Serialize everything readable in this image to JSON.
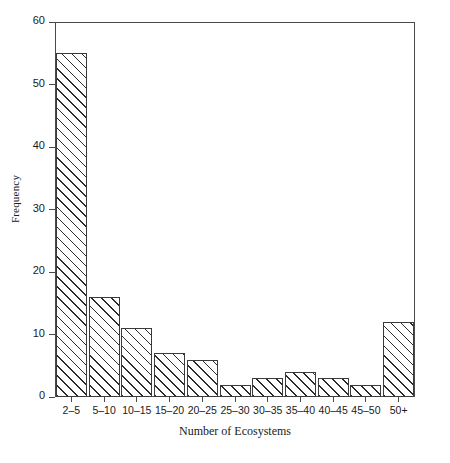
{
  "chart_data": {
    "type": "bar",
    "title": "",
    "xlabel": "Number of Ecosystems",
    "ylabel": "Frequency",
    "categories": [
      "2–5",
      "5–10",
      "10–15",
      "15–20",
      "20–25",
      "25–30",
      "30–35",
      "35–40",
      "40–45",
      "45–50",
      "50+"
    ],
    "values": [
      55,
      16,
      11,
      7,
      6,
      2,
      3,
      4,
      3,
      2,
      12
    ],
    "ylim": [
      0,
      60
    ],
    "yticks": [
      0,
      10,
      20,
      30,
      40,
      50,
      60
    ],
    "ytick_labels": [
      "0",
      "10",
      "20",
      "30",
      "40",
      "50",
      "60"
    ],
    "grid": false,
    "legend": null,
    "bar_style": {
      "fill": "diagonal-hatch",
      "edge_color": "#3a3a3a",
      "face_color": "#ffffff",
      "hatch_color": "#2b2b2b"
    },
    "frame": "box"
  }
}
